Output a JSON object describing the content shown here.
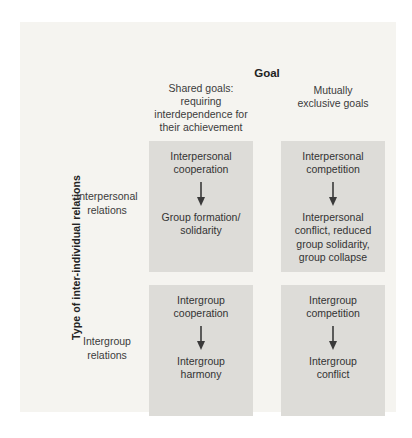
{
  "diagram": {
    "goal_header": "Goal",
    "column_headers": [
      {
        "label": "Shared goals:\nrequiring\ninterdependence for\ntheir achievement"
      },
      {
        "label": "Mutually\nexclusive goals"
      }
    ],
    "y_axis_label": "Type of inter-individual relations",
    "row_headers": [
      {
        "label": "Interpersonal\nrelations"
      },
      {
        "label": "Intergroup\nrelations"
      }
    ],
    "cells": [
      {
        "id": "interpersonal-shared-goals",
        "cause": "Interpersonal\ncooperation",
        "effect": "Group formation/\nsolidarity"
      },
      {
        "id": "interpersonal-exclusive-goals",
        "cause": "Interpersonal\ncompetition",
        "effect": "Interpersonal\nconflict, reduced\ngroup solidarity,\ngroup collapse"
      },
      {
        "id": "intergroup-shared-goals",
        "cause": "Intergroup\ncooperation",
        "effect": "Intergroup\nharmony"
      },
      {
        "id": "intergroup-exclusive-goals",
        "cause": "Intergroup\ncompetition",
        "effect": "Intergroup\nconflict"
      }
    ],
    "colors": {
      "panel_bg": "#f5f4f0",
      "cell_bg": "#dddcd8",
      "text": "#333333",
      "arrow": "#3a3a3a"
    }
  }
}
